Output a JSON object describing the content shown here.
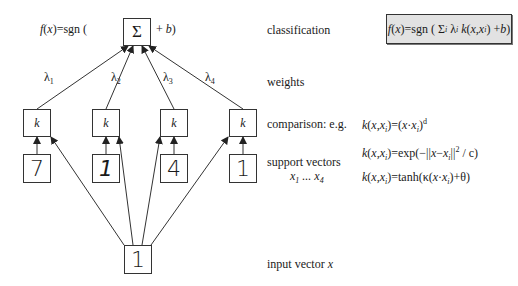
{
  "diagram": {
    "top_formula": {
      "prefix": "f(x)=sgn (",
      "node": "Σ",
      "suffix": "+ b)"
    },
    "weights": [
      "λ1",
      "λ2",
      "λ3",
      "λ4"
    ],
    "weight_symbol": "λ",
    "weight_subscripts": [
      "1",
      "2",
      "3",
      "4"
    ],
    "kernel_label": "k",
    "support_vector_digits": [
      "7",
      "1",
      "4",
      "1"
    ],
    "input_digit": "1"
  },
  "labels": {
    "classification": "classification",
    "weights": "weights",
    "comparison": "comparison: e.g.",
    "support_vectors": "support vectors",
    "support_vectors_range": "x1 ... x4",
    "input_vector": "input vector x"
  },
  "classification_formula": "f(x)=sgn ( Σi λi k(x,xi) + b)",
  "kernel_examples": [
    "k(x,xi)=(x·xi)^d",
    "k(x,xi)=exp(−||x−xi||² / c)",
    "k(x,xi)=tanh(κ(x·xi)+θ)"
  ],
  "colors": {
    "line": "#333333",
    "classification_box_fill": "#e2e2e2"
  }
}
